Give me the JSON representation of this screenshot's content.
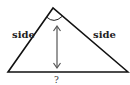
{
  "diagram": {
    "type": "isosceles-triangle",
    "labels": {
      "left_side": "side",
      "right_side": "side",
      "base": "?"
    },
    "colors": {
      "stroke": "#111111",
      "arrow": "#555555",
      "background": "#ffffff"
    },
    "elements": [
      "triangle",
      "apex-angle-arc",
      "height-arrow",
      "side-labels",
      "base-unknown-label"
    ]
  }
}
